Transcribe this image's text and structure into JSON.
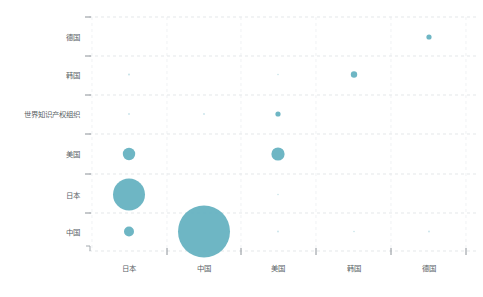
{
  "chart_data": {
    "type": "scatter",
    "title": "",
    "subtitle": "",
    "xlabel": "",
    "ylabel": "",
    "grid": true,
    "legend": "none",
    "categories": [
      "日本",
      "中国",
      "美国",
      "韩国",
      "德国"
    ],
    "x_categories": [
      "日本",
      "中国",
      "美国",
      "韩国",
      "德国"
    ],
    "y_categories": [
      "中国",
      "日本",
      "美国",
      "世界知识产权组织",
      "韩国",
      "德国"
    ],
    "y_categories_top_to_bottom": [
      "德国",
      "韩国",
      "世界知识产权组织",
      "美国",
      "日本",
      "中国"
    ],
    "bubble_color": "#62b0bf",
    "grid_color": "#d9dde0",
    "axis_color": "#9aa0a6",
    "points": [
      {
        "x": "中国",
        "y": "中国",
        "r": 26.0,
        "value": 676
      },
      {
        "x": "日本",
        "y": "日本",
        "r": 16.0,
        "value": 256
      },
      {
        "x": "日本",
        "y": "美国",
        "r": 6.2,
        "value": 38
      },
      {
        "x": "美国",
        "y": "美国",
        "r": 6.6,
        "value": 43
      },
      {
        "x": "日本",
        "y": "中国",
        "r": 5.0,
        "value": 25
      },
      {
        "x": "韩国",
        "y": "韩国",
        "r": 3.2,
        "value": 10
      },
      {
        "x": "德国",
        "y": "德国",
        "r": 2.6,
        "value": 7
      },
      {
        "x": "美国",
        "y": "世界知识产权组织",
        "r": 2.6,
        "value": 7
      },
      {
        "x": "日本",
        "y": "韩国",
        "r": 1.0,
        "value": 1
      },
      {
        "x": "日本",
        "y": "世界知识产权组织",
        "r": 0.9,
        "value": 1
      },
      {
        "x": "中国",
        "y": "世界知识产权组织",
        "r": 0.9,
        "value": 1
      },
      {
        "x": "美国",
        "y": "日本",
        "r": 0.8,
        "value": 1
      },
      {
        "x": "美国",
        "y": "中国",
        "r": 0.9,
        "value": 1
      },
      {
        "x": "韩国",
        "y": "中国",
        "r": 0.8,
        "value": 1
      },
      {
        "x": "德国",
        "y": "中国",
        "r": 0.9,
        "value": 1
      },
      {
        "x": "美国",
        "y": "韩国",
        "r": 0.8,
        "value": 1
      }
    ]
  },
  "axes": {
    "y_ticks": [
      {
        "label": "德国",
        "y": 37
      },
      {
        "label": "韩国",
        "y": 74.5
      },
      {
        "label": "世界知识产权组织",
        "y": 114
      },
      {
        "label": "美国",
        "y": 154
      },
      {
        "label": "日本",
        "y": 194.5
      },
      {
        "label": "中国",
        "y": 231.5
      }
    ],
    "x_ticks": [
      {
        "label": "日本",
        "x": 129
      },
      {
        "label": "中国",
        "x": 204
      },
      {
        "label": "美国",
        "x": 278
      },
      {
        "label": "韩国",
        "x": 354
      },
      {
        "label": "德国",
        "x": 429
      }
    ]
  }
}
